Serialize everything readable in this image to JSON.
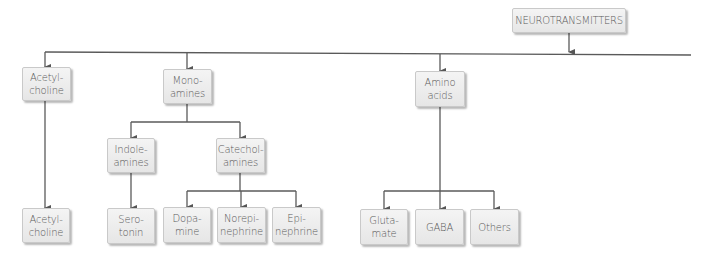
{
  "diagram": {
    "title": "NEUROTRANSMITTERS",
    "root": {
      "label": "NEUROTRANSMITTERS"
    },
    "level1": [
      {
        "id": "acetylcholine",
        "lines": [
          "Acetyl-",
          "choline"
        ]
      },
      {
        "id": "monoamines",
        "lines": [
          "Mono-",
          "amines"
        ]
      },
      {
        "id": "amino-acids",
        "lines": [
          "Amino",
          "acids"
        ]
      }
    ],
    "level2": [
      {
        "id": "indoleamines",
        "parent": "monoamines",
        "lines": [
          "Indole-",
          "amines"
        ]
      },
      {
        "id": "catecholamines",
        "parent": "monoamines",
        "lines": [
          "Catechol-",
          "amines"
        ]
      }
    ],
    "leaves": [
      {
        "id": "acetylcholine-leaf",
        "parent": "acetylcholine",
        "lines": [
          "Acetyl-",
          "choline"
        ]
      },
      {
        "id": "serotonin",
        "parent": "indoleamines",
        "lines": [
          "Sero-",
          "tonin"
        ]
      },
      {
        "id": "dopamine",
        "parent": "catecholamines",
        "lines": [
          "Dopa-",
          "mine"
        ]
      },
      {
        "id": "norepinephrine",
        "parent": "catecholamines",
        "lines": [
          "Norepi-",
          "nephrine"
        ]
      },
      {
        "id": "epinephrine",
        "parent": "catecholamines",
        "lines": [
          "Epi-",
          "nephrine"
        ]
      },
      {
        "id": "glutamate",
        "parent": "amino-acids",
        "lines": [
          "Gluta-",
          "mate"
        ]
      },
      {
        "id": "gaba",
        "parent": "amino-acids",
        "lines": [
          "GABA"
        ]
      },
      {
        "id": "others",
        "parent": "amino-acids",
        "lines": [
          "Others"
        ]
      }
    ],
    "colors": {
      "line": "#555555",
      "box_fill": "#ececec",
      "box_border": "#c9c9c9",
      "text": "#5a5a5a"
    }
  }
}
